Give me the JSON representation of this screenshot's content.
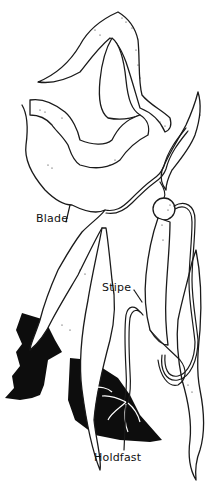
{
  "diagram": {
    "labels": [
      {
        "id": "blade",
        "text": "Blade"
      },
      {
        "id": "stipe",
        "text": "Stipe"
      },
      {
        "id": "holdfast",
        "text": "Holdfast"
      }
    ],
    "colors": {
      "background": "#ffffff",
      "ink": "#1a1a1a",
      "rock": "#0d0d0d"
    }
  }
}
